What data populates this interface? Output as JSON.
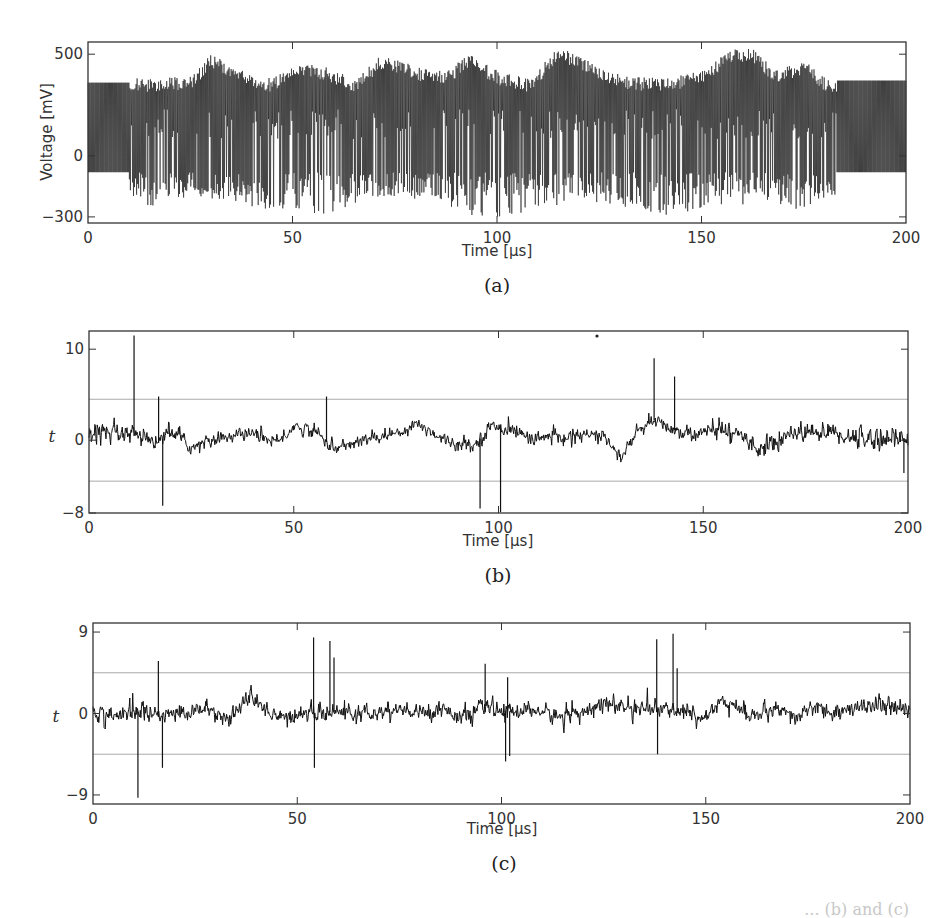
{
  "figure": {
    "caption_fragment": "... (b) and (c)",
    "panels": [
      {
        "id": "a",
        "sublabel": "(a)"
      },
      {
        "id": "b",
        "sublabel": "(b)"
      },
      {
        "id": "c",
        "sublabel": "(c)"
      }
    ]
  },
  "chart_data": [
    {
      "type": "line",
      "panel": "(a)",
      "title": "",
      "xlabel": "Time [µs]",
      "ylabel": "Voltage [mV]",
      "xlim": [
        0,
        200
      ],
      "ylim": [
        -330,
        560
      ],
      "xticks": [
        0,
        50,
        100,
        150,
        200
      ],
      "yticks": [
        -300,
        0,
        500
      ],
      "grid": false,
      "description": "Dense oscillating voltage trace. Regular oscillation between about -80 and 360 mV for t<10 and t>183; irregular bursting region 10-183 with peaks up to ~540 mV and troughs down to ~-300 mV.",
      "series": [
        {
          "name": "voltage",
          "segments": [
            {
              "t_start": 0,
              "t_end": 10,
              "upper": 360,
              "lower": -80,
              "regime": "regular"
            },
            {
              "t_start": 10,
              "t_end": 183,
              "upper_envelope": [
                [
                  10,
                  380
                ],
                [
                  25,
                  390
                ],
                [
                  30,
                  500
                ],
                [
                  38,
                  420
                ],
                [
                  45,
                  380
                ],
                [
                  52,
                  470
                ],
                [
                  58,
                  440
                ],
                [
                  65,
                  380
                ],
                [
                  72,
                  500
                ],
                [
                  80,
                  440
                ],
                [
                  88,
                  420
                ],
                [
                  93,
                  500
                ],
                [
                  100,
                  420
                ],
                [
                  108,
                  380
                ],
                [
                  115,
                  540
                ],
                [
                  122,
                  470
                ],
                [
                  130,
                  400
                ],
                [
                  140,
                  380
                ],
                [
                  150,
                  420
                ],
                [
                  157,
                  520
                ],
                [
                  162,
                  540
                ],
                [
                  168,
                  420
                ],
                [
                  175,
                  470
                ],
                [
                  180,
                  390
                ],
                [
                  183,
                  380
                ]
              ],
              "lower_envelope": [
                [
                  10,
                  -150
                ],
                [
                  15,
                  -280
                ],
                [
                  25,
                  -200
                ],
                [
                  35,
                  -220
                ],
                [
                  50,
                  -300
                ],
                [
                  60,
                  -280
                ],
                [
                  70,
                  -200
                ],
                [
                  80,
                  -220
                ],
                [
                  95,
                  -300
                ],
                [
                  100,
                  -310
                ],
                [
                  120,
                  -220
                ],
                [
                  140,
                  -300
                ],
                [
                  150,
                  -260
                ],
                [
                  165,
                  -230
                ],
                [
                  175,
                  -270
                ],
                [
                  183,
                  -200
                ]
              ],
              "regime": "irregular"
            },
            {
              "t_start": 183,
              "t_end": 200,
              "upper": 370,
              "lower": -80,
              "regime": "regular"
            }
          ]
        }
      ]
    },
    {
      "type": "line",
      "panel": "(b)",
      "title": "",
      "xlabel": "Time [µs]",
      "ylabel": "t",
      "xlim": [
        0,
        200
      ],
      "ylim": [
        -8,
        12
      ],
      "xticks": [
        0,
        50,
        100,
        150,
        200
      ],
      "yticks": [
        -8,
        0,
        10
      ],
      "grid": false,
      "threshold_lines": [
        4.5,
        -4.5
      ],
      "series": [
        {
          "name": "t-statistic",
          "baseline": [
            [
              0,
              0.5
            ],
            [
              10,
              0.6
            ],
            [
              17,
              -0.3
            ],
            [
              20,
              1.0
            ],
            [
              25,
              -0.8
            ],
            [
              32,
              0.3
            ],
            [
              40,
              0.8
            ],
            [
              46,
              -0.3
            ],
            [
              50,
              1.5
            ],
            [
              55,
              1.0
            ],
            [
              60,
              -1.0
            ],
            [
              65,
              -0.2
            ],
            [
              75,
              0.8
            ],
            [
              80,
              1.8
            ],
            [
              88,
              -0.2
            ],
            [
              94,
              -0.6
            ],
            [
              98,
              1.5
            ],
            [
              103,
              1.2
            ],
            [
              108,
              0.2
            ],
            [
              120,
              0.5
            ],
            [
              125,
              0.6
            ],
            [
              128,
              -1.0
            ],
            [
              130,
              -2.0
            ],
            [
              133,
              0.5
            ],
            [
              138,
              2.2
            ],
            [
              142,
              1.2
            ],
            [
              148,
              0.6
            ],
            [
              154,
              1.2
            ],
            [
              160,
              0.4
            ],
            [
              163,
              -0.8
            ],
            [
              168,
              -0.6
            ],
            [
              170,
              0.8
            ],
            [
              178,
              0.9
            ],
            [
              182,
              0.8
            ],
            [
              188,
              0.2
            ],
            [
              200,
              0.2
            ]
          ],
          "noise_amplitude": [
            [
              0,
              1.6
            ],
            [
              30,
              0.9
            ],
            [
              80,
              0.9
            ],
            [
              140,
              1.0
            ],
            [
              180,
              1.4
            ],
            [
              200,
              1.8
            ]
          ],
          "spikes": [
            {
              "t": 11,
              "value": 11.5
            },
            {
              "t": 17,
              "value": 4.8
            },
            {
              "t": 18,
              "value": -7.2
            },
            {
              "t": 58,
              "value": 4.8
            },
            {
              "t": 95.5,
              "value": -7.5
            },
            {
              "t": 100.5,
              "value": -7.9
            },
            {
              "t": 138,
              "value": 9.0
            },
            {
              "t": 143,
              "value": 7.0
            },
            {
              "t": 199,
              "value": -3.6
            }
          ]
        }
      ]
    },
    {
      "type": "line",
      "panel": "(c)",
      "title": "",
      "xlabel": "Time [µs]",
      "ylabel": "t",
      "xlim": [
        0,
        200
      ],
      "ylim": [
        -10,
        10
      ],
      "xticks": [
        0,
        50,
        100,
        150,
        200
      ],
      "yticks": [
        -9,
        0,
        9
      ],
      "grid": false,
      "threshold_lines": [
        4.5,
        -4.5
      ],
      "series": [
        {
          "name": "t-statistic",
          "baseline": [
            [
              0,
              0
            ],
            [
              10,
              -0.2
            ],
            [
              12,
              0.6
            ],
            [
              16,
              -0.4
            ],
            [
              20,
              0
            ],
            [
              28,
              0.6
            ],
            [
              33,
              -0.6
            ],
            [
              38,
              1.6
            ],
            [
              42,
              0.6
            ],
            [
              46,
              -0.5
            ],
            [
              52,
              0.0
            ],
            [
              60,
              0.2
            ],
            [
              68,
              -0.2
            ],
            [
              72,
              0.4
            ],
            [
              80,
              0
            ],
            [
              86,
              0.6
            ],
            [
              90,
              -0.5
            ],
            [
              96,
              0.8
            ],
            [
              100,
              0.2
            ],
            [
              108,
              0.4
            ],
            [
              115,
              -0.5
            ],
            [
              120,
              0.5
            ],
            [
              126,
              1.0
            ],
            [
              132,
              0.6
            ],
            [
              138,
              0.5
            ],
            [
              140,
              0.2
            ],
            [
              144,
              0.6
            ],
            [
              148,
              -0.6
            ],
            [
              154,
              1.5
            ],
            [
              158,
              0.5
            ],
            [
              162,
              -0.2
            ],
            [
              168,
              0.2
            ],
            [
              172,
              -0.6
            ],
            [
              176,
              0.8
            ],
            [
              180,
              0
            ],
            [
              186,
              0.5
            ],
            [
              190,
              1.0
            ],
            [
              194,
              0.8
            ],
            [
              200,
              0.2
            ]
          ],
          "noise_amplitude": [
            [
              0,
              1.3
            ],
            [
              100,
              1.2
            ],
            [
              200,
              1.3
            ]
          ],
          "spikes": [
            {
              "t": 11,
              "value": -9.3
            },
            {
              "t": 16,
              "value": 5.8
            },
            {
              "t": 17,
              "value": -6.0
            },
            {
              "t": 54,
              "value": 8.4
            },
            {
              "t": 54.2,
              "value": -6.0
            },
            {
              "t": 58,
              "value": 8.0
            },
            {
              "t": 59,
              "value": 6.2
            },
            {
              "t": 96,
              "value": 5.5
            },
            {
              "t": 101,
              "value": -5.3
            },
            {
              "t": 101.5,
              "value": 4.0
            },
            {
              "t": 102,
              "value": -4.7
            },
            {
              "t": 138,
              "value": 8.2
            },
            {
              "t": 138.2,
              "value": -4.5
            },
            {
              "t": 142,
              "value": 8.8
            },
            {
              "t": 143,
              "value": 5.0
            }
          ]
        }
      ]
    }
  ]
}
